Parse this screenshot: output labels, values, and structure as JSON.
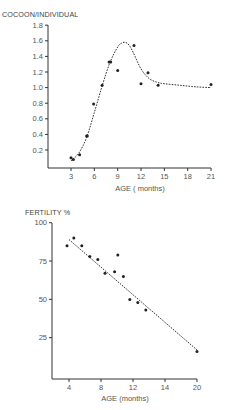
{
  "chart_data": [
    {
      "type": "scatter",
      "title": "COCOON/INDIVIDUAL",
      "xlabel": "AGE ( months)",
      "ylabel": "COCOON/INDIVIDUAL",
      "xlim": [
        0,
        21
      ],
      "ylim": [
        0,
        1.8
      ],
      "x_ticks": [
        3,
        6,
        9,
        12,
        15,
        18,
        21
      ],
      "y_ticks": [
        0.2,
        0.4,
        0.6,
        0.8,
        1.0,
        1.2,
        1.4,
        1.6,
        1.8
      ],
      "x_tick_labels": [
        "3",
        "6",
        "9",
        "12",
        "15",
        "18",
        "21"
      ],
      "y_tick_labels": [
        "0.2",
        "0.4",
        "0.6",
        "0.8",
        "1.0",
        "1.2",
        "1.4",
        "1.6",
        "1.8"
      ],
      "grid": false,
      "series": [
        {
          "name": "observed",
          "kind": "points",
          "x": [
            3.0,
            3.3,
            4.1,
            5.0,
            5.1,
            5.9,
            7.0,
            7.9,
            8.1,
            9.0,
            11.1,
            12.0,
            12.9,
            14.2,
            21.0
          ],
          "y": [
            0.1,
            0.08,
            0.14,
            0.38,
            0.38,
            0.79,
            1.03,
            1.33,
            1.33,
            1.22,
            1.54,
            1.05,
            1.19,
            1.03,
            1.04
          ]
        },
        {
          "name": "fitted curve",
          "kind": "dashed-line",
          "x": [
            3.0,
            4.0,
            5.0,
            6.0,
            7.0,
            8.0,
            9.0,
            9.5,
            10.0,
            10.5,
            11.0,
            12.0,
            13.0,
            14.0,
            15.0,
            17.0,
            19.0,
            21.0
          ],
          "y": [
            0.06,
            0.16,
            0.36,
            0.68,
            1.02,
            1.32,
            1.52,
            1.57,
            1.58,
            1.54,
            1.45,
            1.24,
            1.12,
            1.07,
            1.05,
            1.03,
            1.01,
            1.0
          ]
        }
      ]
    },
    {
      "type": "scatter",
      "title": "FERTILITY %",
      "xlabel": "AGE (months)",
      "ylabel": "FERTILITY %",
      "xlim": [
        2,
        20
      ],
      "ylim": [
        0,
        100
      ],
      "x_ticks": [
        4,
        8,
        12,
        16,
        20
      ],
      "x_tick_labels": [
        "4",
        "8",
        "12",
        "14",
        "20"
      ],
      "y_ticks": [
        25,
        50,
        75,
        100
      ],
      "y_tick_labels": [
        "25",
        "50",
        "75",
        "100"
      ],
      "grid": false,
      "series": [
        {
          "name": "observed",
          "kind": "points",
          "x": [
            3.75,
            4.6,
            5.6,
            6.6,
            7.6,
            8.5,
            9.7,
            10.1,
            10.8,
            11.6,
            12.6,
            13.6,
            20.0
          ],
          "y": [
            85,
            90,
            85,
            78,
            76,
            67,
            68,
            79,
            65,
            50,
            48,
            43,
            16
          ]
        },
        {
          "name": "regression line",
          "kind": "dashed-line",
          "x": [
            4.0,
            20.0
          ],
          "y": [
            89,
            17
          ]
        }
      ]
    }
  ],
  "charts": {
    "top": {
      "title": "COCOON/INDIVIDUAL",
      "xlabel": "AGE ( months)",
      "x_tick_labels": [
        "3",
        "6",
        "9",
        "12",
        "15",
        "18",
        "21"
      ],
      "y_tick_labels": [
        "0.2",
        "0.4",
        "0.6",
        "0.8",
        "1.0",
        "1.2",
        "1.4",
        "1.6",
        "1.8"
      ]
    },
    "bottom": {
      "title": "FERTILITY %",
      "xlabel": "AGE (months)",
      "x_tick_labels": [
        "4",
        "8",
        "12",
        "14",
        "20"
      ],
      "y_tick_labels": [
        "25",
        "50",
        "75",
        "100"
      ]
    }
  },
  "colors": {
    "ink": "#333333",
    "points": "#222222",
    "background": "#ffffff"
  }
}
